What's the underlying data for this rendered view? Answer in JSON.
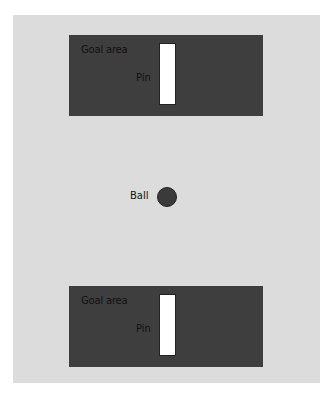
{
  "diagram": {
    "top_goal": {
      "label": "Goal area",
      "pin_label": "Pin"
    },
    "bottom_goal": {
      "label": "Goal area",
      "pin_label": "Pin"
    },
    "ball": {
      "label": "Ball"
    }
  },
  "colors": {
    "field": "#dcdcdc",
    "goal_area": "#3e3e3e",
    "pin": "#ffffff",
    "ball": "#3a3a3a"
  }
}
